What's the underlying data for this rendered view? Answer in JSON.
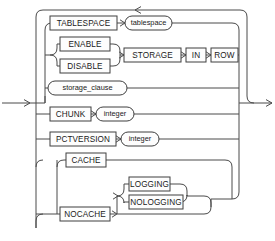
{
  "diagram": {
    "type": "railroad-syntax-diagram",
    "line_color": "#4a4a4a",
    "box_fill": "#fdfdfd",
    "box_stroke": "#3f3f3f",
    "text_color": "#1a1a1a",
    "background": "#ffffff"
  },
  "nodes": {
    "tablespace_kw": {
      "label": "TABLESPACE",
      "shape": "rect"
    },
    "tablespace_var": {
      "label": "tablespace",
      "shape": "oval"
    },
    "enable": {
      "label": "ENABLE",
      "shape": "rect"
    },
    "disable": {
      "label": "DISABLE",
      "shape": "rect"
    },
    "storage": {
      "label": "STORAGE",
      "shape": "rect"
    },
    "in": {
      "label": "IN",
      "shape": "rect"
    },
    "row": {
      "label": "ROW",
      "shape": "rect"
    },
    "storage_clause": {
      "label": "storage_clause",
      "shape": "oval"
    },
    "chunk": {
      "label": "CHUNK",
      "shape": "rect"
    },
    "chunk_integer": {
      "label": "integer",
      "shape": "oval"
    },
    "pctversion": {
      "label": "PCTVERSION",
      "shape": "rect"
    },
    "pctversion_integer": {
      "label": "integer",
      "shape": "oval"
    },
    "cache": {
      "label": "CACHE",
      "shape": "rect"
    },
    "nocache": {
      "label": "NOCACHE",
      "shape": "rect"
    },
    "logging": {
      "label": "LOGGING",
      "shape": "rect"
    },
    "nologging": {
      "label": "NOLOGGING",
      "shape": "rect"
    }
  },
  "branches": [
    "TABLESPACE tablespace",
    "ENABLE | DISABLE STORAGE IN ROW",
    "storage_clause",
    "CHUNK integer",
    "PCTVERSION integer",
    "CACHE | NOCACHE LOGGING | NOLOGGING"
  ]
}
